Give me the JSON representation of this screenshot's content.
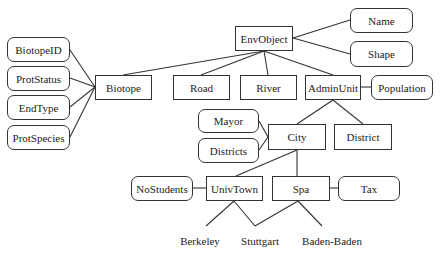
{
  "diagram": {
    "type": "class-hierarchy",
    "classes": [
      {
        "id": "envobject",
        "label": "EnvObject",
        "x": 235,
        "y": 26,
        "w": 58,
        "h": 25
      },
      {
        "id": "biotope",
        "label": "Biotope",
        "x": 95,
        "y": 75,
        "w": 57,
        "h": 25
      },
      {
        "id": "road",
        "label": "Road",
        "x": 173,
        "y": 75,
        "w": 57,
        "h": 25
      },
      {
        "id": "river",
        "label": "River",
        "x": 240,
        "y": 75,
        "w": 57,
        "h": 25
      },
      {
        "id": "adminunit",
        "label": "AdminUnit",
        "x": 305,
        "y": 75,
        "w": 56,
        "h": 25
      },
      {
        "id": "city",
        "label": "City",
        "x": 268,
        "y": 124,
        "w": 58,
        "h": 26
      },
      {
        "id": "district",
        "label": "District",
        "x": 334,
        "y": 124,
        "w": 58,
        "h": 26
      },
      {
        "id": "univtown",
        "label": "UnivTown",
        "x": 206,
        "y": 176,
        "w": 57,
        "h": 25
      },
      {
        "id": "spa",
        "label": "Spa",
        "x": 272,
        "y": 176,
        "w": 58,
        "h": 25
      }
    ],
    "attributes": [
      {
        "id": "name",
        "label": "Name",
        "x": 350,
        "y": 8,
        "w": 63,
        "h": 25
      },
      {
        "id": "shape",
        "label": "Shape",
        "x": 350,
        "y": 41,
        "w": 63,
        "h": 26
      },
      {
        "id": "biotopeid",
        "label": "BiotopeID",
        "x": 7,
        "y": 37,
        "w": 63,
        "h": 25
      },
      {
        "id": "protstatus",
        "label": "ProtStatus",
        "x": 7,
        "y": 66,
        "w": 63,
        "h": 25
      },
      {
        "id": "endtype",
        "label": "EndType",
        "x": 7,
        "y": 95,
        "w": 63,
        "h": 25
      },
      {
        "id": "protspecies",
        "label": "ProtSpecies",
        "x": 7,
        "y": 125,
        "w": 63,
        "h": 25
      },
      {
        "id": "population",
        "label": "Population",
        "x": 371,
        "y": 75,
        "w": 62,
        "h": 25
      },
      {
        "id": "mayor",
        "label": "Mayor",
        "x": 198,
        "y": 109,
        "w": 61,
        "h": 24
      },
      {
        "id": "districts",
        "label": "Districts",
        "x": 198,
        "y": 138,
        "w": 61,
        "h": 25
      },
      {
        "id": "nostudents",
        "label": "NoStudents",
        "x": 131,
        "y": 176,
        "w": 62,
        "h": 25
      },
      {
        "id": "tax",
        "label": "Tax",
        "x": 338,
        "y": 176,
        "w": 62,
        "h": 25
      }
    ],
    "instances": [
      {
        "id": "berkeley",
        "label": "Berkeley",
        "x": 200,
        "y": 235
      },
      {
        "id": "stuttgart",
        "label": "Stuttgart",
        "x": 260,
        "y": 235
      },
      {
        "id": "badenbaden",
        "label": "Baden-Baden",
        "x": 332,
        "y": 235
      }
    ],
    "edges": [
      [
        264,
        51,
        123,
        75
      ],
      [
        264,
        51,
        201,
        75
      ],
      [
        264,
        51,
        268,
        75
      ],
      [
        264,
        51,
        333,
        75
      ],
      [
        293,
        38,
        350,
        20
      ],
      [
        293,
        38,
        350,
        54
      ],
      [
        95,
        87,
        70,
        50
      ],
      [
        95,
        87,
        70,
        78
      ],
      [
        95,
        87,
        70,
        107
      ],
      [
        95,
        87,
        70,
        137
      ],
      [
        361,
        87,
        371,
        87
      ],
      [
        333,
        100,
        297,
        124
      ],
      [
        333,
        100,
        363,
        124
      ],
      [
        268,
        137,
        259,
        121
      ],
      [
        268,
        137,
        259,
        150
      ],
      [
        297,
        150,
        236,
        176
      ],
      [
        297,
        150,
        297,
        176
      ],
      [
        193,
        188,
        206,
        188
      ],
      [
        330,
        188,
        338,
        188
      ],
      [
        234,
        201,
        206,
        226
      ],
      [
        234,
        201,
        255,
        226
      ],
      [
        255,
        226,
        298,
        201
      ],
      [
        298,
        201,
        322,
        226
      ]
    ]
  }
}
